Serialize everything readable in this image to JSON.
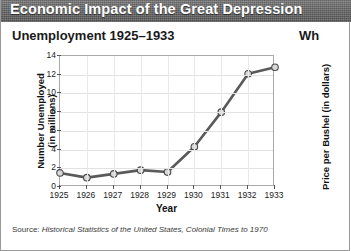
{
  "banner": {
    "title": "Economic Impact of the Great Depression"
  },
  "left_chart": {
    "title": "Unemployment 1925–1933",
    "y_axis_title_line1": "Number Unemployed",
    "y_axis_title_line2": "(in millions)",
    "x_axis_title": "Year",
    "source_label": "Source:",
    "source_title": "Historical Statistics of the United States, Colonial Times to 1970"
  },
  "right_chart": {
    "title": "Wh",
    "y_axis_title": "Price per Bushel (in dollars)"
  },
  "colors": {
    "banner_bg": "#6e6e6e",
    "banner_text": "#ffffff",
    "line": "#5a5a5a",
    "marker_fill": "#d8d8d8",
    "marker_stroke": "#4a4a4a",
    "grid": "#e2e2e2",
    "axis": "#a9a9a9",
    "text": "#1a1a1a"
  },
  "chart_data": {
    "type": "line",
    "title": "Unemployment 1925–1933",
    "xlabel": "Year",
    "ylabel": "Number Unemployed (in millions)",
    "categories": [
      "1925",
      "1926",
      "1927",
      "1928",
      "1929",
      "1930",
      "1931",
      "1932",
      "1933"
    ],
    "values": [
      1.5,
      1.0,
      1.4,
      1.8,
      1.6,
      4.3,
      8.0,
      12.1,
      12.8
    ],
    "ylim": [
      0,
      14
    ],
    "yticks": [
      0,
      2,
      4,
      6,
      8,
      10,
      12,
      14
    ],
    "grid": true,
    "legend": "none",
    "source": "Historical Statistics of the United States, Colonial Times to 1970"
  }
}
